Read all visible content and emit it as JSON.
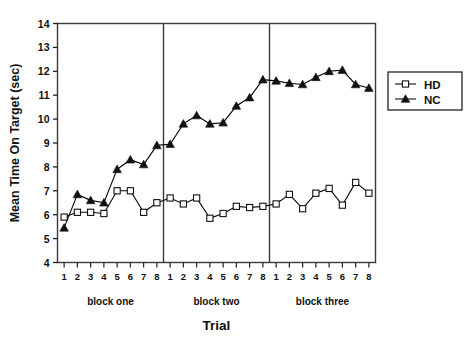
{
  "chart_data": {
    "type": "line",
    "title": "",
    "xlabel": "Trial",
    "ylabel": "Mean Time On Target (sec)",
    "ylim": [
      4,
      14
    ],
    "yticks": [
      4,
      5,
      6,
      7,
      8,
      9,
      10,
      11,
      12,
      13,
      14
    ],
    "ytick_labels": [
      "4",
      "5",
      "6",
      "7",
      "8",
      "9",
      "10",
      "11",
      "12",
      "13",
      "14"
    ],
    "grid": false,
    "legend_position": "right",
    "x": [
      1,
      2,
      3,
      4,
      5,
      6,
      7,
      8,
      9,
      10,
      11,
      12,
      13,
      14,
      15,
      16,
      17,
      18,
      19,
      20,
      21,
      22,
      23,
      24
    ],
    "xtick_labels": [
      "1",
      "2",
      "3",
      "4",
      "5",
      "6",
      "7",
      "8",
      "1",
      "2",
      "3",
      "4",
      "5",
      "6",
      "7",
      "8",
      "1",
      "2",
      "3",
      "4",
      "5",
      "6",
      "7",
      "8"
    ],
    "blocks": [
      {
        "label": "block one",
        "start": 1,
        "end": 8
      },
      {
        "label": "block two",
        "start": 9,
        "end": 16
      },
      {
        "label": "block three",
        "start": 17,
        "end": 24
      }
    ],
    "block_dividers": [
      8.5,
      16.5
    ],
    "series": [
      {
        "name": "HD",
        "marker": "open-square",
        "color": "#000000",
        "values": [
          5.9,
          6.1,
          6.1,
          6.05,
          7.0,
          7.0,
          6.1,
          6.5,
          6.7,
          6.45,
          6.7,
          5.85,
          6.05,
          6.35,
          6.3,
          6.35,
          6.45,
          6.85,
          6.25,
          6.9,
          7.1,
          6.4,
          7.35,
          6.9
        ]
      },
      {
        "name": "NC",
        "marker": "filled-triangle",
        "color": "#000000",
        "values": [
          5.45,
          6.85,
          6.6,
          6.5,
          7.9,
          8.3,
          8.1,
          8.9,
          8.95,
          9.8,
          10.15,
          9.8,
          9.85,
          10.55,
          10.9,
          11.65,
          11.6,
          11.5,
          11.45,
          11.75,
          12.0,
          12.05,
          11.45,
          11.3
        ]
      }
    ]
  },
  "legend": {
    "items": [
      {
        "label": "HD",
        "marker": "open-square"
      },
      {
        "label": "NC",
        "marker": "filled-triangle"
      }
    ]
  },
  "axes": {
    "y_title": "Mean Time On Target (sec)",
    "x_title": "Trial"
  }
}
